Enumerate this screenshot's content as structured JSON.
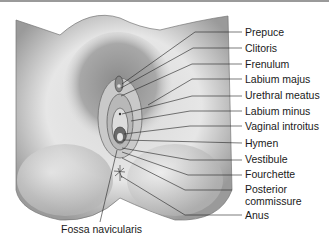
{
  "diagram": {
    "labels": [
      {
        "id": "prepuce",
        "text": "Prepuce",
        "x": 245,
        "y": 27
      },
      {
        "id": "clitoris",
        "text": "Clitoris",
        "x": 245,
        "y": 43
      },
      {
        "id": "frenulum",
        "text": "Frenulum",
        "x": 245,
        "y": 59
      },
      {
        "id": "labium-majus",
        "text": "Labium majus",
        "x": 245,
        "y": 74
      },
      {
        "id": "urethral-meatus",
        "text": "Urethral meatus",
        "x": 245,
        "y": 90
      },
      {
        "id": "labium-minus",
        "text": "Labium minus",
        "x": 245,
        "y": 106
      },
      {
        "id": "vaginal-introitus",
        "text": "Vaginal introitus",
        "x": 245,
        "y": 121
      },
      {
        "id": "hymen",
        "text": "Hymen",
        "x": 245,
        "y": 138
      },
      {
        "id": "vestibule",
        "text": "Vestibule",
        "x": 245,
        "y": 153
      },
      {
        "id": "fourchette",
        "text": "Fourchette",
        "x": 245,
        "y": 169
      },
      {
        "id": "posterior-commissure",
        "text": "Posterior",
        "text2": "commissure",
        "x": 245,
        "y": 184
      },
      {
        "id": "anus",
        "text": "Anus",
        "x": 245,
        "y": 211
      }
    ],
    "bottom_label": {
      "id": "fossa-navicularis",
      "text": "Fossa navicularis",
      "x": 61,
      "y": 224
    }
  }
}
